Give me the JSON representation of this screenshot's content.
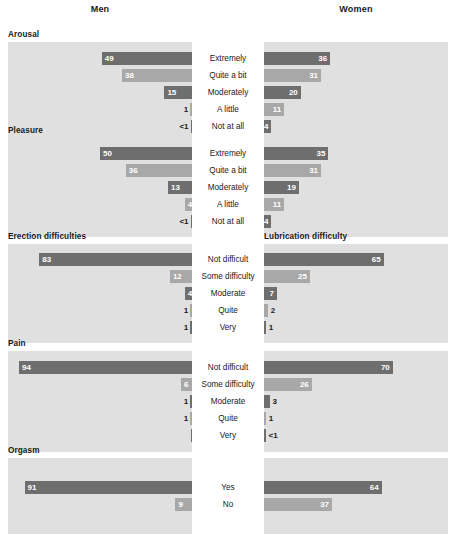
{
  "header": {
    "men_label": "Men",
    "women_label": "Women"
  },
  "chart_data": {
    "type": "bar",
    "title": "",
    "xlabel": "",
    "ylabel": "",
    "orientation": "horizontal-diverging",
    "grid": false,
    "legend_position": "none",
    "value_unit": "percent",
    "axis_max": 100,
    "colors": {
      "bar_dark": "#6e6e6e",
      "bar_light": "#a8a8a8",
      "panel_background": "#e0e0e0",
      "page_background": "#ffffff",
      "label_inside": "#ffffff",
      "label_outside": "#1a1a1a"
    },
    "group_headers": [
      "Men",
      "Women"
    ],
    "sections": [
      {
        "left_title": "Arousal",
        "right_title": "",
        "categories": [
          "Extremely",
          "Quite a bit",
          "Moderately",
          "A little",
          "Not at all"
        ],
        "series": [
          {
            "name": "Men",
            "values": [
              49,
              38,
              15,
              1,
              0.5
            ],
            "labels": [
              "49",
              "38",
              "15",
              "1",
              "<1"
            ],
            "label_placement": [
              "inside",
              "inside",
              "inside",
              "outside",
              "outside"
            ]
          },
          {
            "name": "Women",
            "values": [
              36,
              31,
              20,
              11,
              4
            ],
            "labels": [
              "36",
              "31",
              "20",
              "11",
              "4"
            ],
            "label_placement": [
              "inside",
              "inside",
              "inside",
              "inside",
              "inside"
            ]
          }
        ]
      },
      {
        "left_title": "Pleasure",
        "right_title": "",
        "categories": [
          "Extremely",
          "Quite a bit",
          "Moderately",
          "A little",
          "Not at all"
        ],
        "series": [
          {
            "name": "Men",
            "values": [
              50,
              36,
              13,
              4,
              0.5
            ],
            "labels": [
              "50",
              "36",
              "13",
              "4",
              "<1"
            ],
            "label_placement": [
              "inside",
              "inside",
              "inside",
              "inside",
              "outside"
            ]
          },
          {
            "name": "Women",
            "values": [
              35,
              31,
              19,
              11,
              4
            ],
            "labels": [
              "35",
              "31",
              "19",
              "11",
              "4"
            ],
            "label_placement": [
              "inside",
              "inside",
              "inside",
              "inside",
              "inside"
            ]
          }
        ]
      },
      {
        "left_title": "Erection difficulties",
        "right_title": "Lubrication difficulty",
        "categories": [
          "Not difficult",
          "Some difficulty",
          "Moderate",
          "Quite",
          "Very"
        ],
        "series": [
          {
            "name": "Men",
            "values": [
              83,
              12,
              4,
              1,
              1
            ],
            "labels": [
              "83",
              "12",
              "4",
              "1",
              "1"
            ],
            "label_placement": [
              "inside",
              "inside",
              "inside",
              "outside",
              "outside"
            ]
          },
          {
            "name": "Women",
            "values": [
              65,
              25,
              7,
              2,
              1
            ],
            "labels": [
              "65",
              "25",
              "7",
              "2",
              "1"
            ],
            "label_placement": [
              "inside",
              "inside",
              "inside",
              "outside",
              "outside"
            ]
          }
        ]
      },
      {
        "left_title": "Pain",
        "right_title": "",
        "categories": [
          "Not difficult",
          "Some difficulty",
          "Moderate",
          "Quite",
          "Very"
        ],
        "series": [
          {
            "name": "Men",
            "values": [
              94,
              6,
              1,
              1,
              0
            ],
            "labels": [
              "94",
              "6",
              "1",
              "1",
              ""
            ],
            "label_placement": [
              "inside",
              "inside",
              "outside",
              "outside",
              "none"
            ]
          },
          {
            "name": "Women",
            "values": [
              70,
              26,
              3,
              1,
              0.5
            ],
            "labels": [
              "70",
              "26",
              "3",
              "1",
              "<1"
            ],
            "label_placement": [
              "inside",
              "inside",
              "outside",
              "outside",
              "outside"
            ]
          }
        ]
      },
      {
        "left_title": "Orgasm",
        "right_title": "",
        "categories": [
          "Yes",
          "No"
        ],
        "series": [
          {
            "name": "Men",
            "values": [
              91,
              9
            ],
            "labels": [
              "91",
              "9"
            ],
            "label_placement": [
              "inside",
              "inside"
            ]
          },
          {
            "name": "Women",
            "values": [
              64,
              37
            ],
            "labels": [
              "64",
              "37"
            ],
            "label_placement": [
              "inside",
              "inside"
            ]
          }
        ]
      }
    ]
  }
}
